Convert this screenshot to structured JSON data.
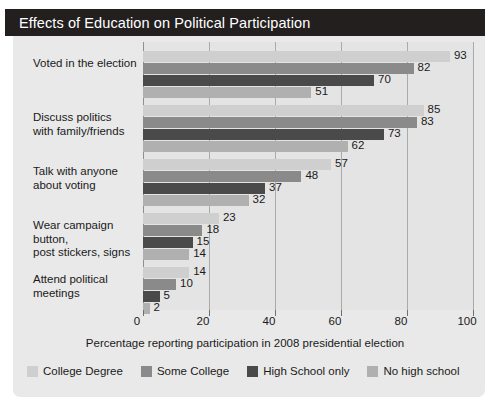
{
  "title": "Effects of Education on Political Participation",
  "chart_data": {
    "type": "bar",
    "orientation": "horizontal",
    "title": "Effects of Education on Political Participation",
    "xlabel": "Percentage reporting participation in 2008 presidential election",
    "ylabel": "",
    "xlim": [
      0,
      100
    ],
    "xticks": [
      0,
      20,
      40,
      60,
      80,
      100
    ],
    "grid": true,
    "legend_position": "bottom",
    "categories": [
      "Voted in the election",
      "Discuss politics with family/friends",
      "Talk with anyone about voting",
      "Wear campaign button, post stickers, signs",
      "Attend political meetings"
    ],
    "category_lines": [
      [
        "Voted in the election"
      ],
      [
        "Discuss politics",
        "with family/friends"
      ],
      [
        "Talk with anyone",
        "about voting"
      ],
      [
        "Wear campaign button,",
        "post stickers, signs"
      ],
      [
        "Attend political",
        "meetings"
      ]
    ],
    "series": [
      {
        "name": "College Degree",
        "color": "#cfcfcf",
        "values": [
          93,
          85,
          57,
          23,
          14
        ]
      },
      {
        "name": "Some College",
        "color": "#8a8a8a",
        "values": [
          82,
          83,
          48,
          18,
          10
        ]
      },
      {
        "name": "High School only",
        "color": "#4a4a4a",
        "values": [
          70,
          73,
          37,
          15,
          5
        ]
      },
      {
        "name": "No high school",
        "color": "#b0b0b0",
        "values": [
          51,
          62,
          32,
          14,
          2
        ]
      }
    ]
  },
  "colors": {
    "title_bar": "#231f1f",
    "card": "#e9e9e9",
    "plot": "#e4e4e4",
    "gridline": "#aaaaaa",
    "text": "#1a1a1a"
  }
}
